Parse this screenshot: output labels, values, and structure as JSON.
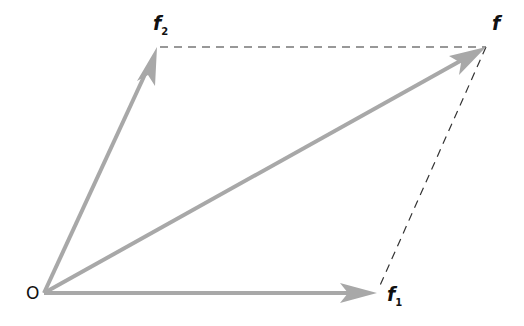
{
  "diagram": {
    "origin_label": "O",
    "vectors": [
      {
        "name": "f1",
        "label": "f",
        "subscript": "1",
        "from": [
          44,
          293
        ],
        "to": [
          377,
          293
        ]
      },
      {
        "name": "f2",
        "label": "f",
        "subscript": "2",
        "from": [
          44,
          293
        ],
        "to": [
          157,
          47
        ]
      },
      {
        "name": "f",
        "label": "f",
        "subscript": "",
        "from": [
          44,
          293
        ],
        "to": [
          486,
          47
        ]
      }
    ],
    "dashed_lines": [
      {
        "from": [
          160,
          47
        ],
        "to": [
          486,
          47
        ]
      },
      {
        "from": [
          486,
          47
        ],
        "to": [
          377,
          293
        ]
      }
    ],
    "colors": {
      "arrow": "#a8a8a8",
      "dash": "#333333",
      "text": "#111111"
    }
  }
}
